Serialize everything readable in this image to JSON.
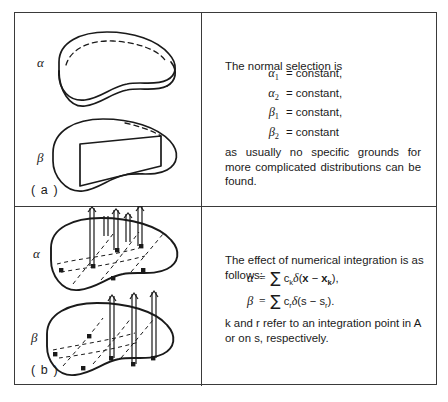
{
  "figure": {
    "panels": [
      {
        "id": "a",
        "label": "( a )",
        "shapes": [
          {
            "symbol": "α",
            "description": "area-domain-slab"
          },
          {
            "symbol": "β",
            "description": "area-domain-with-cut-plane"
          }
        ],
        "text": {
          "intro": "The normal selection is",
          "equations": [
            {
              "symbol": "α",
              "subscript": "1",
              "relation": "=",
              "value": "constant,"
            },
            {
              "symbol": "α",
              "subscript": "2",
              "relation": "=",
              "value": "constant,"
            },
            {
              "symbol": "β",
              "subscript": "1",
              "relation": "=",
              "value": "constant,"
            },
            {
              "symbol": "β",
              "subscript": "2",
              "relation": "=",
              "value": "constant"
            }
          ],
          "note": "as usually no specific grounds for more complicated distributions can be found."
        }
      },
      {
        "id": "b",
        "label": "( b )",
        "shapes": [
          {
            "symbol": "α",
            "description": "domain-with-interior-delta-spikes"
          },
          {
            "symbol": "β",
            "description": "domain-with-boundary-delta-spikes"
          }
        ],
        "text": {
          "intro": "The effect of numerical integration is as follows:",
          "equations": [
            {
              "lhs": "α",
              "relation": "=",
              "sum": "∑",
              "coefficient": "c",
              "coefficient_sub": "k",
              "delta": "δ",
              "argument_open": "(",
              "argument_var": "x",
              "argument_minus": "−",
              "argument_point": "x",
              "argument_point_sub": "k",
              "argument_close": "),"
            },
            {
              "lhs": "β",
              "relation": "=",
              "sum": "∑",
              "coefficient": "c",
              "coefficient_sub": "r",
              "delta": "δ",
              "argument_open": "(",
              "argument_var": "s",
              "argument_minus": "−",
              "argument_point": "s",
              "argument_point_sub": "r",
              "argument_close": ")."
            }
          ],
          "note": "k and r refer to an integration point in A or on s, respectively."
        }
      }
    ]
  },
  "colors": {
    "ink": "#1a1a1a",
    "frame": "#3a3a3a",
    "background": "#ffffff"
  }
}
